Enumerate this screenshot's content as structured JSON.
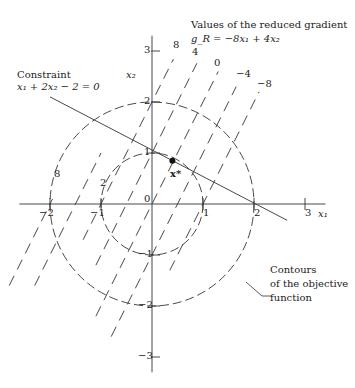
{
  "figure": {
    "title_lines": [
      "Values of the reduced gradient",
      "g_R = −8x₁ + 4x₂"
    ],
    "constraint_label": [
      "Constraint",
      "x₁ + 2x₂ − 2 = 0"
    ],
    "objective_label": [
      "Contours",
      "of the objective",
      "function"
    ],
    "optimum_label": "x*",
    "axis_x_label": "x₁",
    "axis_y_label": "x₂",
    "x_ticks": [
      {
        "v": -2,
        "t": "−2"
      },
      {
        "v": -1,
        "t": "−1"
      },
      {
        "v": 1,
        "t": "1"
      },
      {
        "v": 2,
        "t": "2"
      },
      {
        "v": 3,
        "t": "3"
      }
    ],
    "y_ticks": [
      {
        "v": 3,
        "t": "3"
      },
      {
        "v": 2,
        "t": "2"
      },
      {
        "v": 1,
        "t": "1"
      },
      {
        "v": -1,
        "t": "−1"
      },
      {
        "v": -2,
        "t": "−2"
      },
      {
        "v": -3,
        "t": "−3"
      }
    ],
    "origin_label": "0",
    "contour_labels": [
      {
        "text": "8",
        "x": 57,
        "y": 174
      },
      {
        "text": "2",
        "x": 103,
        "y": 183
      }
    ],
    "gradient_line_labels": [
      {
        "text": "8",
        "x": 177,
        "y": 45
      },
      {
        "text": "4",
        "x": 196,
        "y": 52
      },
      {
        "text": "0",
        "x": 218,
        "y": 63
      },
      {
        "text": "−4",
        "x": 240,
        "y": 74
      },
      {
        "text": "−8",
        "x": 261,
        "y": 84
      }
    ],
    "colors": {
      "ink": "#333333",
      "background": "#ffffff"
    }
  },
  "geometry": {
    "origin_px": [
      152,
      204
    ],
    "scale_px_per_unit": 51,
    "x_axis_range": [
      -2.6,
      3.4
    ],
    "y_axis_range": [
      -3.3,
      3.3
    ],
    "circles": [
      {
        "r": 1,
        "value": 2
      },
      {
        "r": 2,
        "value": 8
      }
    ],
    "constraint_segment": [
      [
        -2.0,
        2.1
      ],
      [
        2.65,
        -0.32
      ]
    ],
    "optimum_point": [
      0.4,
      0.85
    ],
    "gradient_lines": [
      {
        "c": 8,
        "x1_range": [
          -1.35,
          0.42
        ]
      },
      {
        "c": 4,
        "x1_range": [
          -1.1,
          0.88
        ]
      },
      {
        "c": 0,
        "x1_range": [
          -1.1,
          1.3
        ]
      },
      {
        "c": -4,
        "x1_range": [
          -0.8,
          1.65
        ]
      },
      {
        "c": -8,
        "x1_range": [
          0.35,
          2.1
        ]
      },
      {
        "c": 12,
        "x1_range": [
          -2.3,
          -1.0
        ]
      },
      {
        "c": 16,
        "x1_range": [
          -2.8,
          -1.95
        ]
      }
    ]
  }
}
